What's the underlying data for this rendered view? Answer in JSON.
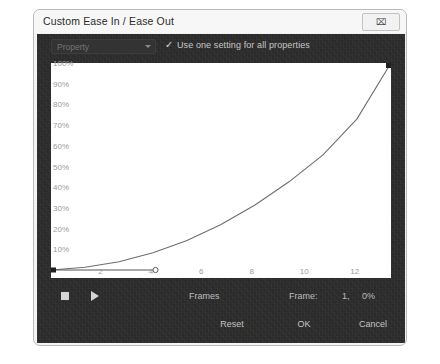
{
  "window": {
    "title": "Custom Ease In / Ease Out",
    "close_icon": "close-icon",
    "close_glyph": "⌧"
  },
  "toolbar": {
    "property_select_value": "Property",
    "caret_icon": "chevron-down-icon",
    "checkbox_checked": true,
    "check_glyph": "✓",
    "checkbox_label": "Use one setting for all properties"
  },
  "transport": {
    "stop_icon": "stop-icon",
    "play_icon": "play-icon",
    "frames_label": "Frames",
    "frame_readout_label": "Frame:",
    "frame_number": "1,",
    "frame_percent": "0%"
  },
  "footer": {
    "reset_label": "Reset",
    "ok_label": "OK",
    "cancel_label": "Cancel"
  },
  "colors": {
    "page_background": "#ffffff",
    "dialog_background": "#f3f3f3",
    "dialog_border": "#b9b9b9",
    "titlebar_background": "#f7f7f7",
    "panel_background": "#2b2b2b",
    "graph_background": "#ffffff",
    "curve_stroke": "#6e6e6e",
    "axis_label": "#9a9a9a",
    "handle_line": "#555555",
    "anchor_fill": "#1f1f1f",
    "text_light": "#c6c6c6"
  },
  "chart_data": {
    "type": "line",
    "title": "",
    "xlabel": "",
    "ylabel": "",
    "xlim": [
      0,
      13.5
    ],
    "ylim": [
      0,
      100
    ],
    "grid": false,
    "x_ticks": [
      2,
      4,
      6,
      8,
      10,
      12
    ],
    "x_tick_labels": [
      "2",
      "4",
      "6",
      "8",
      "10",
      "12"
    ],
    "y_ticks": [
      10,
      20,
      30,
      40,
      50,
      60,
      70,
      80,
      90,
      100
    ],
    "y_tick_labels": [
      "10%",
      "20%",
      "30%",
      "40%",
      "50%",
      "60%",
      "70%",
      "80%",
      "90%",
      "100%"
    ],
    "series": [
      {
        "name": "Custom ease curve",
        "kind": "bezier",
        "x": [
          0.0,
          1.35,
          2.7,
          4.05,
          5.4,
          6.75,
          8.1,
          9.45,
          10.8,
          12.15,
          13.5
        ],
        "values": [
          0.0,
          1.3,
          4.0,
          8.3,
          14.3,
          22.0,
          31.4,
          42.6,
          55.6,
          73.0,
          100.0
        ]
      }
    ],
    "control_points": [
      {
        "name": "start-anchor",
        "x": 0.0,
        "y": 0.0,
        "shape": "square"
      },
      {
        "name": "start-handle",
        "x": 4.15,
        "y": 0.0,
        "shape": "circle"
      },
      {
        "name": "end-anchor",
        "x": 13.5,
        "y": 100.0,
        "shape": "square"
      }
    ],
    "handle_lines": [
      {
        "from": "start-anchor",
        "to": "start-handle"
      }
    ]
  }
}
